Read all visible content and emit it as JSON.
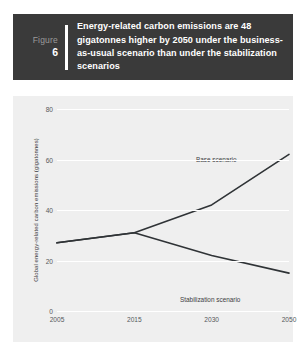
{
  "header": {
    "figure_word": "Figure",
    "figure_number": "6",
    "title": "Energy-related carbon emissions are 48 gigatonnes higher by 2050 under the business-as-usual scenario than under the stabilization scenarios",
    "background_color": "#3a3a3a",
    "text_color": "#ffffff",
    "label_color": "#9a9a9a"
  },
  "chart_data": {
    "type": "line",
    "title": "",
    "xlabel": "",
    "ylabel": "Global energy-related carbon emissions (gigatonnes)",
    "categories": [
      "2005",
      "2015",
      "2030",
      "2050"
    ],
    "x": [
      2005,
      2015,
      2030,
      2050
    ],
    "series": [
      {
        "name": "Base scenario",
        "values": [
          27,
          31,
          42,
          62
        ]
      },
      {
        "name": "Stabilization scenario",
        "values": [
          27,
          31,
          22,
          15
        ]
      }
    ],
    "ylim": [
      0,
      80
    ],
    "yticks": [
      0,
      20,
      40,
      60,
      80
    ],
    "ytick_labels": [
      "0",
      "20",
      "40",
      "60",
      "80"
    ],
    "xtick_labels": [
      "2005",
      "2015",
      "2030",
      "2050"
    ],
    "grid": true,
    "grid_color": "#ffffff",
    "legend": "annotations-inline",
    "annotations": [
      {
        "label": "Base scenario"
      },
      {
        "label": "Stabilization scenario"
      }
    ],
    "line_color": "#2f3336",
    "plot_background": "#efefef"
  }
}
